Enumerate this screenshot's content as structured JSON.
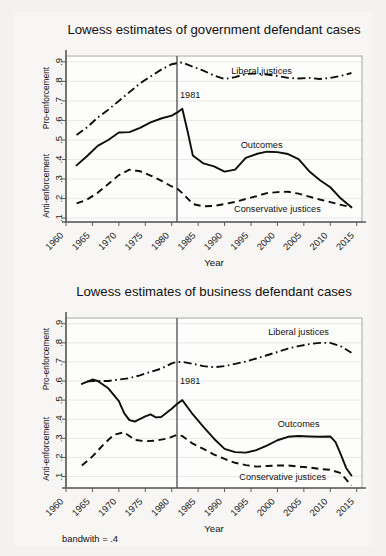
{
  "figure": {
    "background_color": "#f3f2f0",
    "paper_color": "#f7f6f4",
    "ink_color": "#0d0d0d",
    "note": "bandwith = .4"
  },
  "charts": [
    {
      "id": "government-defendant",
      "title": "Lowess estimates of government defendant cases",
      "xlabel": "Year",
      "ylabel_upper": "Pro-enforcement",
      "ylabel_lower": "Anti-enforcement",
      "reference_line_label": "1981",
      "labels": {
        "liberal": "Liberal justices",
        "outcomes": "Outcomes",
        "conservative": "Conservative justices"
      }
    },
    {
      "id": "business-defendant",
      "title": "Lowess estimates of business defendant cases",
      "xlabel": "Year",
      "ylabel_upper": "Pro-enforcement",
      "ylabel_lower": "Anti-enforcement",
      "reference_line_label": "1981",
      "labels": {
        "liberal": "Liberal justices",
        "outcomes": "Outcomes",
        "conservative": "Conservative justices"
      }
    }
  ],
  "chart_data": [
    {
      "type": "line",
      "title": "Lowess estimates of government defendant cases",
      "xlabel": "Year",
      "ylabel": "Anti-enforcement / Pro-enforcement",
      "xlim": [
        1960,
        2016
      ],
      "ylim": [
        0.08,
        0.93
      ],
      "xticks": [
        1960,
        1965,
        1970,
        1975,
        1980,
        1985,
        1990,
        1995,
        2000,
        2005,
        2010,
        2015
      ],
      "yticks": [
        0.1,
        0.2,
        0.3,
        0.4,
        0.5,
        0.6,
        0.7,
        0.8,
        0.9
      ],
      "grid": true,
      "legend": "inline-annotations",
      "annotations": [
        {
          "text": "1981",
          "x": 1981,
          "y": 0.73
        },
        {
          "text": "Liberal justices",
          "x": 1997,
          "y": 0.855
        },
        {
          "text": "Outcomes",
          "x": 1997,
          "y": 0.475
        },
        {
          "text": "Conservative justices",
          "x": 2000,
          "y": 0.145
        }
      ],
      "reference_lines": [
        {
          "x": 1981,
          "label": "1981"
        }
      ],
      "series": [
        {
          "name": "Liberal justices",
          "style": "dash-dot",
          "x": [
            1962,
            1964,
            1966,
            1968,
            1970,
            1972,
            1974,
            1976,
            1978,
            1980,
            1981,
            1982,
            1984,
            1986,
            1988,
            1990,
            1992,
            1994,
            1996,
            1998,
            2000,
            2002,
            2004,
            2006,
            2008,
            2010,
            2012,
            2014
          ],
          "values": [
            0.525,
            0.565,
            0.615,
            0.655,
            0.7,
            0.745,
            0.79,
            0.825,
            0.86,
            0.888,
            0.893,
            0.897,
            0.875,
            0.855,
            0.83,
            0.812,
            0.822,
            0.838,
            0.84,
            0.835,
            0.828,
            0.818,
            0.815,
            0.818,
            0.812,
            0.818,
            0.828,
            0.843
          ]
        },
        {
          "name": "Outcomes",
          "style": "solid",
          "x": [
            1962,
            1964,
            1966,
            1968,
            1970,
            1972,
            1974,
            1976,
            1978,
            1980,
            1981,
            1982,
            1983,
            1984,
            1986,
            1988,
            1990,
            1992,
            1994,
            1996,
            1998,
            2000,
            2002,
            2004,
            2006,
            2008,
            2010,
            2012,
            2014
          ],
          "values": [
            0.37,
            0.418,
            0.47,
            0.5,
            0.538,
            0.54,
            0.562,
            0.59,
            0.61,
            0.625,
            0.64,
            0.66,
            0.545,
            0.42,
            0.38,
            0.365,
            0.338,
            0.348,
            0.408,
            0.428,
            0.44,
            0.438,
            0.428,
            0.402,
            0.34,
            0.295,
            0.258,
            0.2,
            0.155
          ]
        },
        {
          "name": "Conservative justices",
          "style": "dashed",
          "x": [
            1962,
            1964,
            1966,
            1968,
            1970,
            1972,
            1974,
            1976,
            1978,
            1980,
            1981,
            1982,
            1984,
            1986,
            1988,
            1990,
            1992,
            1994,
            1996,
            1998,
            2000,
            2002,
            2004,
            2006,
            2008,
            2010,
            2012,
            2014
          ],
          "values": [
            0.175,
            0.195,
            0.23,
            0.275,
            0.32,
            0.348,
            0.34,
            0.318,
            0.292,
            0.262,
            0.252,
            0.228,
            0.172,
            0.16,
            0.162,
            0.172,
            0.183,
            0.198,
            0.212,
            0.228,
            0.233,
            0.235,
            0.225,
            0.21,
            0.195,
            0.182,
            0.168,
            0.155
          ]
        }
      ]
    },
    {
      "type": "line",
      "title": "Lowess estimates of business defendant cases",
      "xlabel": "Year",
      "ylabel": "Anti-enforcement / Pro-enforcement",
      "xlim": [
        1960,
        2016
      ],
      "ylim": [
        0.04,
        0.93
      ],
      "xticks": [
        1960,
        1965,
        1970,
        1975,
        1980,
        1985,
        1990,
        1995,
        2000,
        2005,
        2010,
        2015
      ],
      "yticks": [
        0.1,
        0.2,
        0.3,
        0.4,
        0.5,
        0.6,
        0.7,
        0.8,
        0.9
      ],
      "grid": true,
      "legend": "inline-annotations",
      "annotations": [
        {
          "text": "1981",
          "x": 1981,
          "y": 0.6
        },
        {
          "text": "Liberal justices",
          "x": 2004,
          "y": 0.855
        },
        {
          "text": "Outcomes",
          "x": 2004,
          "y": 0.375
        },
        {
          "text": "Conservative justices",
          "x": 2001,
          "y": 0.095
        }
      ],
      "reference_lines": [
        {
          "x": 1981,
          "label": "1981"
        }
      ],
      "series": [
        {
          "name": "Liberal justices",
          "style": "dash-dot",
          "x": [
            1964,
            1966,
            1968,
            1970,
            1972,
            1974,
            1976,
            1978,
            1980,
            1981,
            1982,
            1984,
            1986,
            1988,
            1990,
            1992,
            1994,
            1996,
            1998,
            2000,
            2002,
            2004,
            2006,
            2008,
            2010,
            2012,
            2014
          ],
          "values": [
            0.598,
            0.6,
            0.6,
            0.608,
            0.615,
            0.63,
            0.648,
            0.665,
            0.692,
            0.7,
            0.7,
            0.69,
            0.678,
            0.672,
            0.678,
            0.69,
            0.702,
            0.718,
            0.735,
            0.752,
            0.77,
            0.783,
            0.793,
            0.8,
            0.8,
            0.782,
            0.748
          ]
        },
        {
          "name": "Outcomes",
          "style": "solid",
          "x": [
            1963,
            1965,
            1966,
            1968,
            1970,
            1971,
            1972,
            1973,
            1975,
            1976,
            1977,
            1978,
            1980,
            1981,
            1982,
            1984,
            1986,
            1988,
            1990,
            1992,
            1994,
            1996,
            1998,
            2000,
            2002,
            2004,
            2006,
            2008,
            2010,
            2011,
            2012,
            2013,
            2014
          ],
          "values": [
            0.585,
            0.608,
            0.6,
            0.562,
            0.495,
            0.432,
            0.395,
            0.388,
            0.415,
            0.425,
            0.41,
            0.412,
            0.455,
            0.48,
            0.5,
            0.425,
            0.36,
            0.298,
            0.245,
            0.228,
            0.225,
            0.238,
            0.262,
            0.29,
            0.308,
            0.312,
            0.31,
            0.308,
            0.31,
            0.28,
            0.215,
            0.145,
            0.105
          ]
        },
        {
          "name": "Conservative justices",
          "style": "dashed",
          "x": [
            1963,
            1965,
            1967,
            1969,
            1971,
            1973,
            1975,
            1977,
            1979,
            1980,
            1981,
            1982,
            1984,
            1986,
            1988,
            1990,
            1992,
            1994,
            1996,
            1998,
            2000,
            2002,
            2004,
            2006,
            2008,
            2010,
            2012,
            2013,
            2014
          ],
          "values": [
            0.158,
            0.205,
            0.265,
            0.318,
            0.332,
            0.292,
            0.285,
            0.288,
            0.298,
            0.308,
            0.318,
            0.312,
            0.272,
            0.245,
            0.215,
            0.192,
            0.172,
            0.16,
            0.152,
            0.155,
            0.158,
            0.158,
            0.152,
            0.148,
            0.14,
            0.135,
            0.118,
            0.085,
            0.052
          ]
        }
      ]
    }
  ]
}
